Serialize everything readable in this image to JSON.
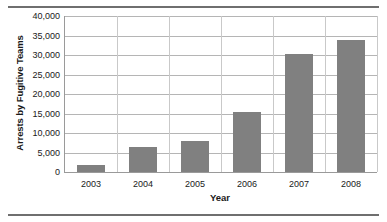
{
  "chart_data": {
    "type": "bar",
    "title": "",
    "xlabel": "Year",
    "ylabel": "Arrests by Fugitive Teams",
    "categories": [
      "2003",
      "2004",
      "2005",
      "2006",
      "2007",
      "2008"
    ],
    "values": [
      1900,
      6500,
      7900,
      15400,
      30200,
      33800
    ],
    "series": [
      {
        "name": "Arrests by Fugitive Teams",
        "values": [
          1900,
          6500,
          7900,
          15400,
          30200,
          33800
        ]
      }
    ],
    "ylim": [
      0,
      40000
    ],
    "ytick_values": [
      0,
      5000,
      10000,
      15000,
      20000,
      25000,
      30000,
      35000,
      40000
    ],
    "ytick_labels": [
      "0",
      "5,000",
      "10,000",
      "15,000",
      "20,000",
      "25,000",
      "30,000",
      "35,000",
      "40,000"
    ],
    "xtick_labels": [
      "2003",
      "2004",
      "2005",
      "2006",
      "2007",
      "2008"
    ],
    "grid": "both",
    "legend": "none",
    "bar_color": "#808080",
    "grid_color": "#b5b5b5",
    "axis_color": "#9a9a9a",
    "text_color": "#1a1a1a",
    "rule_color": "#6f6f6f"
  },
  "figure": {
    "top_rule": "",
    "bottom_rule": ""
  }
}
